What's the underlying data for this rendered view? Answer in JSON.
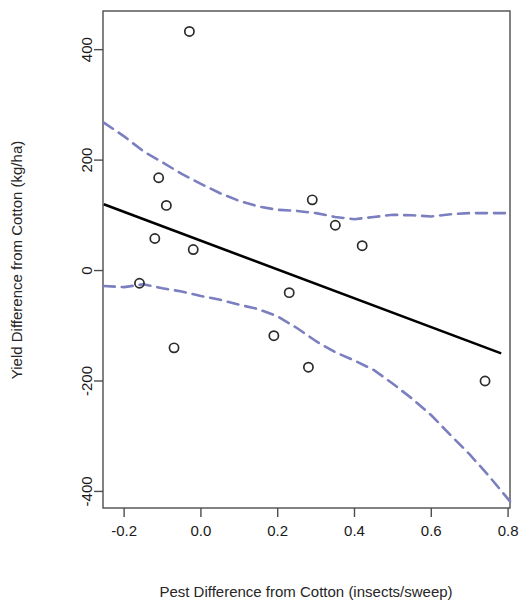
{
  "chart_data": {
    "type": "scatter",
    "title": "",
    "xlabel": "Pest Difference from Cotton (insects/sweep)",
    "ylabel": "Yield Difference from Cotton (kg/ha)",
    "xlim": [
      -0.255,
      0.805
    ],
    "ylim": [
      -430,
      470
    ],
    "grid": false,
    "legend": null,
    "xticks": [
      -0.2,
      0.0,
      0.2,
      0.4,
      0.6,
      0.8
    ],
    "xticklabels": [
      "-0.2",
      "0.0",
      "0.2",
      "0.4",
      "0.6",
      "0.8"
    ],
    "yticks": [
      -400,
      -200,
      0,
      200,
      400
    ],
    "yticklabels": [
      "-400",
      "-200",
      "0",
      "200",
      "400"
    ],
    "colors": {
      "points": "#2b2b2b",
      "fit_line": "#000000",
      "confidence_band": "#7b7fc0",
      "frame": "#4d4d4d"
    },
    "series": [
      {
        "name": "observations",
        "type": "scatter",
        "marker": "open-circle",
        "points": [
          {
            "x": -0.03,
            "y": 433
          },
          {
            "x": -0.11,
            "y": 168
          },
          {
            "x": -0.09,
            "y": 118
          },
          {
            "x": -0.12,
            "y": 58
          },
          {
            "x": -0.02,
            "y": 38
          },
          {
            "x": -0.16,
            "y": -23
          },
          {
            "x": 0.29,
            "y": 128
          },
          {
            "x": 0.35,
            "y": 82
          },
          {
            "x": 0.42,
            "y": 45
          },
          {
            "x": 0.23,
            "y": -40
          },
          {
            "x": 0.19,
            "y": -118
          },
          {
            "x": -0.07,
            "y": -140
          },
          {
            "x": 0.28,
            "y": -175
          },
          {
            "x": 0.74,
            "y": -200
          }
        ]
      },
      {
        "name": "regression-line",
        "type": "line",
        "style": "solid",
        "points": [
          {
            "x": -0.253,
            "y": 120
          },
          {
            "x": 0.782,
            "y": -150
          }
        ]
      },
      {
        "name": "upper-confidence-limit",
        "type": "line",
        "style": "dashed",
        "points": [
          {
            "x": -0.253,
            "y": 268
          },
          {
            "x": -0.2,
            "y": 243
          },
          {
            "x": -0.15,
            "y": 216
          },
          {
            "x": -0.1,
            "y": 196
          },
          {
            "x": -0.05,
            "y": 175
          },
          {
            "x": 0.0,
            "y": 157
          },
          {
            "x": 0.05,
            "y": 140
          },
          {
            "x": 0.1,
            "y": 126
          },
          {
            "x": 0.15,
            "y": 116
          },
          {
            "x": 0.2,
            "y": 110
          },
          {
            "x": 0.25,
            "y": 108
          },
          {
            "x": 0.3,
            "y": 104
          },
          {
            "x": 0.35,
            "y": 97
          },
          {
            "x": 0.4,
            "y": 93
          },
          {
            "x": 0.45,
            "y": 97
          },
          {
            "x": 0.5,
            "y": 101
          },
          {
            "x": 0.55,
            "y": 100
          },
          {
            "x": 0.6,
            "y": 98
          },
          {
            "x": 0.65,
            "y": 102
          },
          {
            "x": 0.7,
            "y": 104
          },
          {
            "x": 0.75,
            "y": 104
          },
          {
            "x": 0.805,
            "y": 104
          }
        ]
      },
      {
        "name": "lower-confidence-limit",
        "type": "line",
        "style": "dashed",
        "points": [
          {
            "x": -0.253,
            "y": -28
          },
          {
            "x": -0.2,
            "y": -30
          },
          {
            "x": -0.15,
            "y": -25
          },
          {
            "x": -0.1,
            "y": -32
          },
          {
            "x": -0.05,
            "y": -38
          },
          {
            "x": 0.0,
            "y": -46
          },
          {
            "x": 0.05,
            "y": -53
          },
          {
            "x": 0.1,
            "y": -62
          },
          {
            "x": 0.15,
            "y": -70
          },
          {
            "x": 0.2,
            "y": -83
          },
          {
            "x": 0.25,
            "y": -104
          },
          {
            "x": 0.3,
            "y": -128
          },
          {
            "x": 0.35,
            "y": -148
          },
          {
            "x": 0.4,
            "y": -163
          },
          {
            "x": 0.45,
            "y": -180
          },
          {
            "x": 0.5,
            "y": -205
          },
          {
            "x": 0.55,
            "y": -232
          },
          {
            "x": 0.6,
            "y": -262
          },
          {
            "x": 0.65,
            "y": -298
          },
          {
            "x": 0.7,
            "y": -333
          },
          {
            "x": 0.75,
            "y": -372
          },
          {
            "x": 0.805,
            "y": -418
          }
        ]
      }
    ]
  }
}
